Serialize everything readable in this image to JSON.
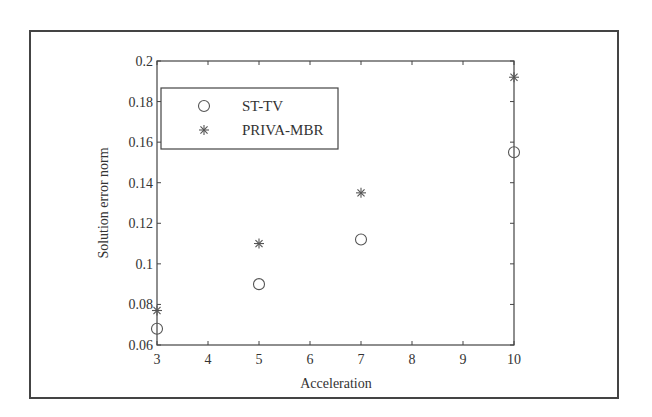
{
  "chart_data": {
    "type": "scatter",
    "title": "",
    "xlabel": "Acceleration",
    "ylabel": "Solution error norm",
    "xlim": [
      3,
      10
    ],
    "ylim": [
      0.06,
      0.2
    ],
    "xticks": [
      3,
      4,
      5,
      6,
      7,
      8,
      9,
      10
    ],
    "yticks": [
      0.06,
      0.08,
      0.1,
      0.12,
      0.14,
      0.16,
      0.18,
      0.2
    ],
    "xtick_labels": [
      "3",
      "4",
      "5",
      "6",
      "7",
      "8",
      "9",
      "10"
    ],
    "ytick_labels": [
      "0.06",
      "0.08",
      "0.1",
      "0.12",
      "0.14",
      "0.16",
      "0.18",
      "0.2"
    ],
    "grid": false,
    "legend_position": "upper left",
    "x": [
      3,
      5,
      7,
      10
    ],
    "series": [
      {
        "name": "ST-TV",
        "marker": "circle",
        "values": [
          0.068,
          0.09,
          0.112,
          0.155
        ]
      },
      {
        "name": "PRIVA-MBR",
        "marker": "asterisk",
        "values": [
          0.077,
          0.11,
          0.135,
          0.192
        ]
      }
    ]
  },
  "legend": {
    "items": [
      {
        "label": "ST-TV",
        "marker": "circle"
      },
      {
        "label": "PRIVA-MBR",
        "marker": "asterisk"
      }
    ]
  },
  "colors": {
    "axis": "#444444",
    "marker": "#555555",
    "text": "#333333"
  }
}
